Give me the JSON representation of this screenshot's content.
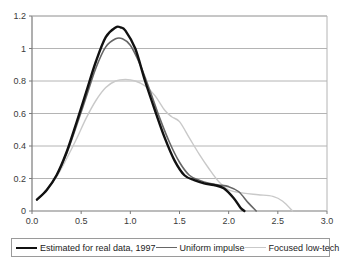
{
  "chart_data": {
    "type": "line",
    "title": "",
    "xlabel": "",
    "ylabel": "",
    "xlim": [
      0.0,
      3.0
    ],
    "ylim": [
      0.0,
      1.2
    ],
    "grid": "horizontal",
    "legend_position": "bottom",
    "x_ticks": [
      "0.0",
      "0.5",
      "1.0",
      "1.5",
      "2.0",
      "2.5",
      "3.0"
    ],
    "x_tick_values": [
      0.0,
      0.5,
      1.0,
      1.5,
      2.0,
      2.5,
      3.0
    ],
    "y_ticks": [
      "0",
      "0.2",
      "0.4",
      "0.6",
      "0.8",
      "1",
      "1.2"
    ],
    "y_tick_values": [
      0.0,
      0.2,
      0.4,
      0.6,
      0.8,
      1.0,
      1.2
    ],
    "series": [
      {
        "name": "Estimated for real data, 1997",
        "color": "#111111",
        "width": 2.4,
        "x": [
          0.05,
          0.15,
          0.25,
          0.35,
          0.45,
          0.55,
          0.65,
          0.75,
          0.85,
          0.9,
          0.95,
          1.05,
          1.15,
          1.25,
          1.35,
          1.45,
          1.55,
          1.65,
          1.75,
          1.85,
          1.95,
          2.05,
          2.12,
          2.16
        ],
        "y": [
          0.07,
          0.13,
          0.22,
          0.36,
          0.54,
          0.73,
          0.92,
          1.07,
          1.13,
          1.13,
          1.11,
          1.0,
          0.8,
          0.62,
          0.45,
          0.31,
          0.22,
          0.19,
          0.17,
          0.16,
          0.14,
          0.08,
          0.02,
          0.0
        ]
      },
      {
        "name": "Uniform impulse",
        "color": "#666666",
        "width": 1.6,
        "x": [
          0.05,
          0.15,
          0.25,
          0.35,
          0.45,
          0.55,
          0.65,
          0.75,
          0.85,
          0.92,
          1.0,
          1.1,
          1.2,
          1.3,
          1.4,
          1.5,
          1.6,
          1.7,
          1.8,
          1.9,
          2.0,
          2.1,
          2.2,
          2.28
        ],
        "y": [
          0.07,
          0.13,
          0.22,
          0.35,
          0.52,
          0.7,
          0.88,
          1.01,
          1.06,
          1.06,
          1.02,
          0.9,
          0.74,
          0.57,
          0.42,
          0.3,
          0.22,
          0.19,
          0.17,
          0.16,
          0.15,
          0.12,
          0.05,
          0.0
        ]
      },
      {
        "name": "Focused low-tech",
        "color": "#c9c9c9",
        "width": 1.4,
        "x": [
          0.05,
          0.15,
          0.25,
          0.35,
          0.45,
          0.55,
          0.65,
          0.75,
          0.85,
          0.95,
          1.05,
          1.15,
          1.25,
          1.35,
          1.42,
          1.5,
          1.6,
          1.7,
          1.8,
          1.9,
          2.0,
          2.15,
          2.3,
          2.45,
          2.55,
          2.65
        ],
        "y": [
          0.07,
          0.13,
          0.21,
          0.32,
          0.44,
          0.57,
          0.68,
          0.76,
          0.8,
          0.81,
          0.8,
          0.77,
          0.71,
          0.62,
          0.58,
          0.55,
          0.45,
          0.35,
          0.26,
          0.18,
          0.13,
          0.11,
          0.1,
          0.09,
          0.06,
          0.0
        ]
      }
    ],
    "legend": [
      "Estimated for real data, 1997",
      "Uniform impulse",
      "Focused low-tech"
    ],
    "colors": {
      "series_1": "#111111",
      "series_2": "#666666",
      "series_3": "#c9c9c9",
      "gridline": "#b4b4b4",
      "axis": "#7a7a7a",
      "text": "#3a3a3a",
      "background": "#ffffff"
    }
  }
}
